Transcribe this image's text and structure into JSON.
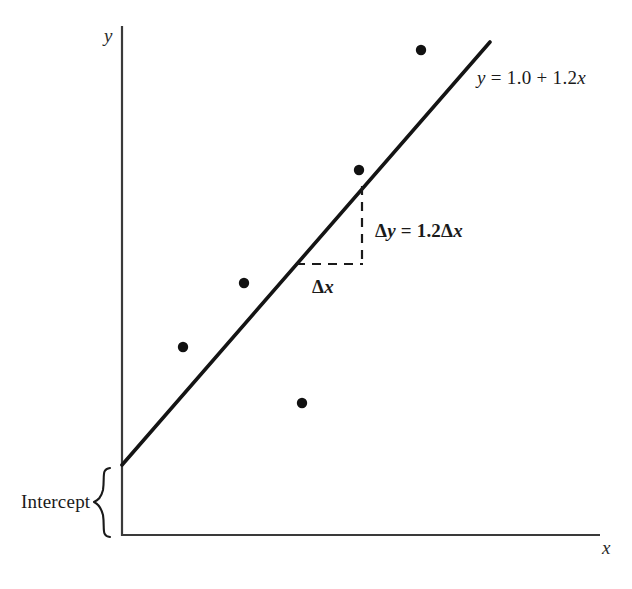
{
  "figure": {
    "background_color": "#ffffff",
    "ink_color": "#1a1a1a",
    "axis_color": "#3a3a3a",
    "width": 632,
    "height": 589
  },
  "axes": {
    "y_label": "y",
    "x_label": "x",
    "y_axis": {
      "x": 122,
      "y_top": 26,
      "y_bottom": 536
    },
    "x_axis": {
      "y": 535,
      "x_left": 122,
      "x_right": 600
    }
  },
  "annotations": {
    "equation": "y = 1.0 + 1.2x",
    "delta_y": "Δy = 1.2Δx",
    "delta_x": "Δx",
    "intercept": "Intercept"
  },
  "chart_data": {
    "type": "scatter",
    "title": "",
    "xlabel": "x",
    "ylabel": "y",
    "grid": false,
    "legend": "none",
    "axis_style": "open L-shaped axes, no tick marks, no tick labels",
    "points": [
      {
        "px": 421,
        "py": 50
      },
      {
        "px": 359,
        "py": 170
      },
      {
        "px": 244,
        "py": 283
      },
      {
        "px": 183,
        "py": 347
      },
      {
        "px": 302,
        "py": 403
      }
    ],
    "point_marker": "filled circle",
    "point_radius_px": 5.2,
    "series": [
      {
        "name": "regression line",
        "type": "line",
        "equation": "y = 1.0 + 1.2x",
        "intercept": 1.0,
        "slope": 1.2,
        "px_start": {
          "x": 122,
          "y": 465
        },
        "px_end": {
          "x": 490,
          "y": 42
        },
        "linewidth_px": 3.6
      }
    ],
    "slope_triangle": {
      "label_rise": "Δy = 1.2Δx",
      "label_run": "Δx",
      "style": "dashed",
      "vertical_x": 362,
      "vertical_y_top": 186,
      "vertical_y_bottom": 265,
      "horizontal_y": 264,
      "horizontal_x_left": 297,
      "horizontal_x_right": 363
    },
    "intercept_marker": {
      "label": "Intercept",
      "style": "curly brace",
      "brace_x": 106,
      "brace_y_top": 468,
      "brace_y_bottom": 537,
      "spans": "from x-axis up to the y-intercept of the regression line"
    }
  }
}
